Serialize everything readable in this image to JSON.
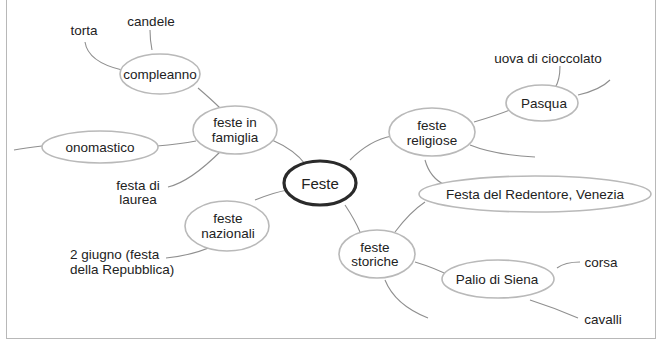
{
  "diagram": {
    "type": "mind-map",
    "central": {
      "id": "feste",
      "label": "Feste"
    },
    "branches": [
      {
        "id": "feste-in-famiglia",
        "label_l1": "feste in",
        "label_l2": "famiglia",
        "children": [
          {
            "id": "compleanno",
            "label": "compleanno",
            "children": [
              "torta",
              "candele"
            ]
          },
          {
            "id": "onomastico",
            "label": "onomastico"
          },
          {
            "id": "festa-di-laurea",
            "label_l1": "festa di",
            "label_l2": "laurea"
          }
        ]
      },
      {
        "id": "feste-nazionali",
        "label_l1": "feste",
        "label_l2": "nazionali",
        "children": [
          {
            "id": "2-giugno",
            "label_l1": "2 giugno (festa",
            "label_l2": "della Repubblica)"
          }
        ]
      },
      {
        "id": "feste-religiose",
        "label_l1": "feste",
        "label_l2": "religiose",
        "children": [
          {
            "id": "pasqua",
            "label": "Pasqua",
            "children": [
              "uova di cioccolato"
            ]
          },
          {
            "id": "festa-del-redentore",
            "label": "Festa del Redentore, Venezia"
          }
        ]
      },
      {
        "id": "feste-storiche",
        "label_l1": "feste",
        "label_l2": "storiche",
        "children": [
          {
            "id": "palio-di-siena",
            "label": "Palio di Siena",
            "children": [
              "corsa",
              "cavalli"
            ]
          }
        ]
      }
    ]
  },
  "labels": {
    "feste": "Feste",
    "famiglia_1": "feste in",
    "famiglia_2": "famiglia",
    "compleanno": "compleanno",
    "torta": "torta",
    "candele": "candele",
    "onomastico": "onomastico",
    "laurea_1": "festa di",
    "laurea_2": "laurea",
    "nazionali_1": "feste",
    "nazionali_2": "nazionali",
    "giugno_1": "2 giugno (festa",
    "giugno_2": "della Repubblica)",
    "religiose_1": "feste",
    "religiose_2": "religiose",
    "pasqua": "Pasqua",
    "uova": "uova di cioccolato",
    "redentore": "Festa del Redentore, Venezia",
    "storiche_1": "feste",
    "storiche_2": "storiche",
    "palio": "Palio di Siena",
    "corsa": "corsa",
    "cavalli": "cavalli"
  },
  "colors": {
    "central_border": "#2a2a2a",
    "node_border": "#b9b9b9",
    "link": "#8f8f8f",
    "frame": "#b8b8b8"
  }
}
